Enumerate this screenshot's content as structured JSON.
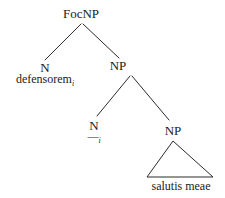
{
  "diagram": {
    "type": "syntax-tree",
    "background_color": "#ffffff",
    "line_color": "#2b2b2b",
    "text_color": "#1a1a1a",
    "nodes": {
      "root": "FocNP",
      "left_daughter": "N",
      "right_daughter": "NP",
      "inner_left_daughter": "N",
      "inner_right_daughter": "NP"
    },
    "terminals": {
      "focused_noun": "defensorem",
      "focused_noun_index": "i",
      "trace": "—",
      "trace_index": "i",
      "phrase": "salutis meae"
    }
  }
}
